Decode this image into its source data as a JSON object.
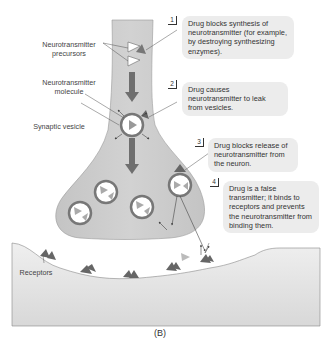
{
  "figure": {
    "panel_label": "(B)",
    "labels": {
      "precursors": "Neurotransmitter precursors",
      "molecule": "Neurotransmitter molecule",
      "vesicle": "Synaptic vesicle",
      "receptors": "Receptors"
    },
    "callouts": [
      {
        "num": "1",
        "text": "Drug blocks synthesis of neurotransmitter (for example, by destroying synthesizing enzymes)."
      },
      {
        "num": "2",
        "text": "Drug causes neurotransmitter to leak from vesicles."
      },
      {
        "num": "3",
        "text": "Drug blocks release of neurotransmitter from the neuron."
      },
      {
        "num": "4",
        "text": "Drug is a false transmitter; it binds to receptors and prevents the neurotransmitter from binding them."
      }
    ],
    "colors": {
      "neuron_fill": "#c9c9c9",
      "postsynaptic_fill": "#e6e6e6",
      "arrow": "#6f6f6f",
      "drug_triangle": "#777777",
      "callout_bg": "#ececec"
    }
  }
}
